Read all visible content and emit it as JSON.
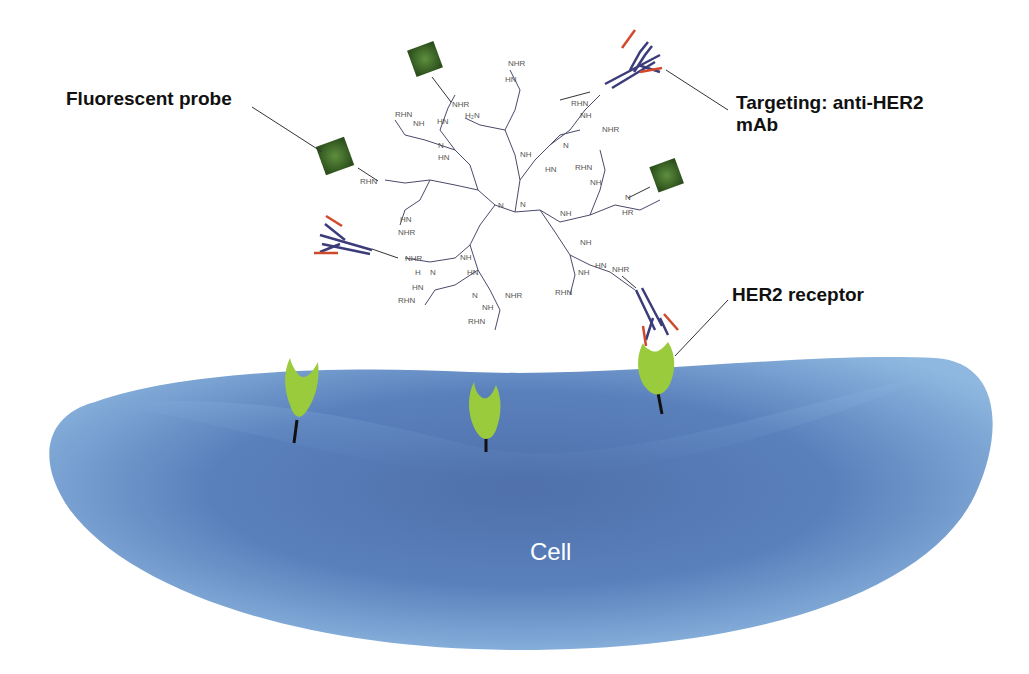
{
  "diagram": {
    "labels": {
      "fluorescent_probe": "Fluorescent probe",
      "targeting_line1": "Targeting: anti-HER2",
      "targeting_line2": "mAb",
      "her2_receptor": "HER2 receptor",
      "cell": "Cell"
    },
    "chemistry_terminal_groups": [
      "NHR",
      "RHN",
      "NH",
      "HN",
      "H2N",
      "N",
      "O",
      "H",
      "HR"
    ],
    "components": [
      {
        "name": "PAMAM dendrimer",
        "color": "#4a4a6a"
      },
      {
        "name": "fluorescent probe",
        "color": "#3d6b2a",
        "count": 3
      },
      {
        "name": "anti-HER2 mAb",
        "color_heavy": "#3c3c7a",
        "color_light": "#d0492a",
        "count": 3
      },
      {
        "name": "HER2 receptor",
        "color": "#9acb3c",
        "count": 3
      },
      {
        "name": "cell",
        "color": "#5b86c0"
      }
    ]
  }
}
